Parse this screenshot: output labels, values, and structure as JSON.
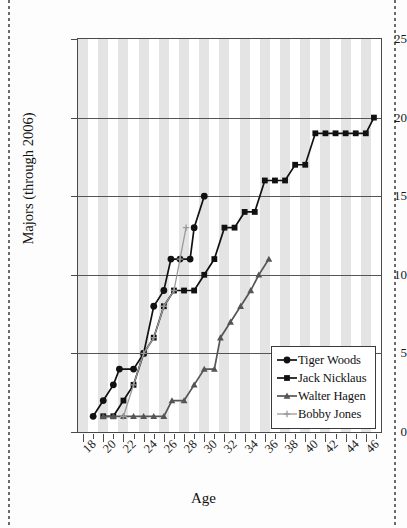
{
  "chart_data": {
    "type": "line",
    "title": "",
    "xlabel": "Age",
    "ylabel": "Majors (through 2006)",
    "xlim": [
      17.5,
      47.5
    ],
    "ylim": [
      0,
      25
    ],
    "xticks": [
      18,
      20,
      22,
      24,
      26,
      28,
      30,
      32,
      34,
      36,
      38,
      40,
      42,
      44,
      46
    ],
    "yticks": [
      0,
      5,
      10,
      15,
      20,
      25
    ],
    "grid": "horizontal-gridlines-at-5-10-15-20 plus alternating vertical year bands",
    "legend_position": "lower-right-inside",
    "series": [
      {
        "name": "Tiger Woods",
        "marker": "filled-circle",
        "color": "#111111",
        "points": [
          [
            19,
            1
          ],
          [
            20,
            2
          ],
          [
            21,
            3
          ],
          [
            21.6,
            4
          ],
          [
            23,
            4
          ],
          [
            24,
            5
          ],
          [
            25,
            8
          ],
          [
            26,
            9
          ],
          [
            26.7,
            11
          ],
          [
            27.6,
            11
          ],
          [
            28.6,
            11
          ],
          [
            29,
            13
          ],
          [
            30,
            15
          ]
        ]
      },
      {
        "name": "Jack Nicklaus",
        "marker": "filled-square",
        "color": "#111111",
        "points": [
          [
            20,
            1
          ],
          [
            21,
            1
          ],
          [
            22,
            2
          ],
          [
            23,
            3
          ],
          [
            24,
            5
          ],
          [
            25,
            6
          ],
          [
            26,
            8
          ],
          [
            27,
            9
          ],
          [
            28,
            9
          ],
          [
            29,
            9
          ],
          [
            30,
            10
          ],
          [
            31,
            11
          ],
          [
            32,
            13
          ],
          [
            33,
            13
          ],
          [
            34,
            14
          ],
          [
            35,
            14
          ],
          [
            36,
            16
          ],
          [
            37,
            16
          ],
          [
            38,
            16
          ],
          [
            39,
            17
          ],
          [
            40,
            17
          ],
          [
            41,
            19
          ],
          [
            42,
            19
          ],
          [
            43,
            19
          ],
          [
            44,
            19
          ],
          [
            45,
            19
          ],
          [
            46,
            19
          ],
          [
            46.8,
            20
          ]
        ]
      },
      {
        "name": "Walter Hagen",
        "marker": "triangle",
        "color": "#555555",
        "points": [
          [
            20,
            1
          ],
          [
            21,
            1
          ],
          [
            22,
            1
          ],
          [
            23,
            1
          ],
          [
            24,
            1
          ],
          [
            25,
            1
          ],
          [
            26,
            1
          ],
          [
            26.8,
            2
          ],
          [
            28,
            2
          ],
          [
            29,
            3
          ],
          [
            30,
            4
          ],
          [
            31,
            4
          ],
          [
            31.6,
            6
          ],
          [
            32.6,
            7
          ],
          [
            33.6,
            8
          ],
          [
            34.6,
            9
          ],
          [
            35.4,
            10
          ],
          [
            36.4,
            11
          ]
        ]
      },
      {
        "name": "Bobby Jones",
        "marker": "plus",
        "color": "#9a9a9a",
        "points": [
          [
            22,
            1
          ],
          [
            23,
            3
          ],
          [
            24,
            5
          ],
          [
            25,
            6
          ],
          [
            26,
            8
          ],
          [
            27,
            9
          ],
          [
            27.6,
            11
          ],
          [
            28.2,
            13
          ]
        ]
      }
    ]
  },
  "axes": {
    "y_label": "Majors (through 2006)",
    "x_label": "Age",
    "y_tick_labels": [
      "0",
      "5",
      "10",
      "15",
      "20",
      "25"
    ],
    "x_tick_labels": [
      "18",
      "20",
      "22",
      "24",
      "26",
      "28",
      "30",
      "32",
      "34",
      "36",
      "38",
      "40",
      "42",
      "44",
      "46"
    ]
  },
  "legend": {
    "entries": [
      {
        "label": "Tiger Woods",
        "marker": "filled-circle",
        "color": "#111111"
      },
      {
        "label": "Jack Nicklaus",
        "marker": "filled-square",
        "color": "#111111"
      },
      {
        "label": "Walter Hagen",
        "marker": "triangle",
        "color": "#555555"
      },
      {
        "label": "Bobby Jones",
        "marker": "plus",
        "color": "#9a9a9a"
      }
    ]
  },
  "colors": {
    "band": "#e4e4e4",
    "frame": "#4a4a4a",
    "gridline": "#555555",
    "background": "#ffffff"
  }
}
